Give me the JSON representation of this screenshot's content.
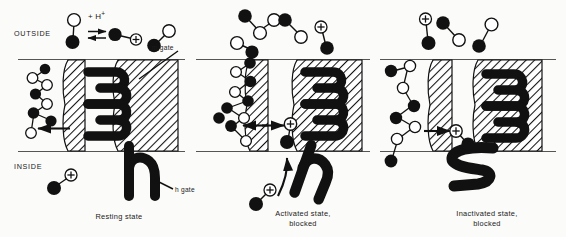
{
  "figure": {
    "width": 566,
    "height": 237,
    "background_color": "#fbfbf9",
    "ink_color": "#111111"
  },
  "axis_labels": {
    "outside": "OUTSIDE",
    "inside": "INSIDE"
  },
  "reaction_label": {
    "text": "+ H",
    "superscript": "+",
    "full": "+ H⁺"
  },
  "gate_labels": {
    "m_gate": "m gate",
    "h_gate": "h gate"
  },
  "gate_glyphs": {
    "m_gate_glyph": "3",
    "h_gate_glyph_resting": "h",
    "h_gate_glyph_activated": "h",
    "h_gate_glyph_inactivated": "s"
  },
  "panels": [
    {
      "id": "panel-resting",
      "caption_lines": [
        "Resting state"
      ],
      "caption": "Resting state",
      "state": "resting",
      "m_gate_open": false,
      "h_gate_open": true,
      "ion_bound": false
    },
    {
      "id": "panel-activated",
      "caption_lines": [
        "Activated state,",
        "blocked"
      ],
      "caption": "Activated state, blocked",
      "state": "activated",
      "m_gate_open": true,
      "h_gate_open": true,
      "ion_bound": true
    },
    {
      "id": "panel-inactivated",
      "caption_lines": [
        "Inactivated state,",
        "blocked"
      ],
      "caption": "Inactivated state, blocked",
      "state": "inactivated",
      "m_gate_open": true,
      "h_gate_open": false,
      "ion_bound": true
    }
  ],
  "legend_symbols": {
    "filled_circle": "hydrophobic-group",
    "open_circle": "polar-group",
    "plus_circle": "proton-cation",
    "hatched_block": "membrane-lipid",
    "equilibrium_arrows": "reversible-protonation"
  },
  "colors": {
    "ink": "#111111",
    "membrane_fill": "#d9d9d4",
    "paper": "#fbfbf9",
    "line": "#555555"
  }
}
